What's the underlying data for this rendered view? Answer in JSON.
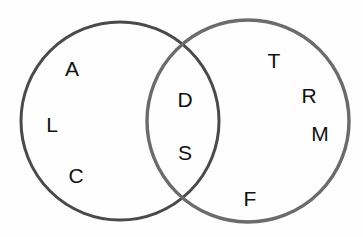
{
  "diagram": {
    "type": "venn-two-set",
    "background_color": "#fefefe",
    "width": 363,
    "height": 237,
    "label_color": "#111111",
    "label_font_size": 21,
    "circles": [
      {
        "id": "left-circle",
        "name": "left-set-circle",
        "cx": 120,
        "cy": 121,
        "r": 99,
        "stroke_color": "#4a4a4a",
        "stroke_width": 3,
        "fill": "none"
      },
      {
        "id": "right-circle",
        "name": "right-set-circle",
        "cx": 248,
        "cy": 121,
        "r": 101,
        "stroke_color": "#6b6b6b",
        "stroke_width": 3.4,
        "fill": "none"
      }
    ],
    "regions": {
      "left_only": {
        "name": "left-only-region",
        "items": [
          {
            "text": "A",
            "x": 72,
            "y": 68
          },
          {
            "text": "L",
            "x": 52,
            "y": 124
          },
          {
            "text": "C",
            "x": 76,
            "y": 175
          }
        ]
      },
      "intersection": {
        "name": "intersection-region",
        "items": [
          {
            "text": "D",
            "x": 185,
            "y": 99
          },
          {
            "text": "S",
            "x": 185,
            "y": 152
          }
        ]
      },
      "right_only": {
        "name": "right-only-region",
        "items": [
          {
            "text": "T",
            "x": 274,
            "y": 60
          },
          {
            "text": "R",
            "x": 309,
            "y": 95
          },
          {
            "text": "M",
            "x": 320,
            "y": 133
          },
          {
            "text": "F",
            "x": 250,
            "y": 198
          }
        ]
      }
    }
  },
  "chart_data": {
    "type": "venn",
    "title": "",
    "sets": [
      {
        "name": "Left set",
        "members": [
          "A",
          "L",
          "C",
          "D",
          "S"
        ]
      },
      {
        "name": "Right set",
        "members": [
          "T",
          "R",
          "M",
          "F",
          "D",
          "S"
        ]
      }
    ],
    "left_only": [
      "A",
      "L",
      "C"
    ],
    "intersection": [
      "D",
      "S"
    ],
    "right_only": [
      "T",
      "R",
      "M",
      "F"
    ],
    "counts": {
      "left_only": 3,
      "intersection": 2,
      "right_only": 4,
      "total": 9
    },
    "legend": [],
    "xlabel": "",
    "ylabel": ""
  }
}
